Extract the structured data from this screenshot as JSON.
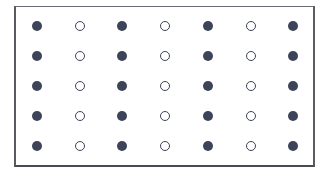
{
  "grid": {
    "rows": 5,
    "columns": 7,
    "pattern_description": "alternating filled and hollow dots by column; odd columns filled, even columns hollow",
    "column_types": [
      "filled",
      "hollow",
      "filled",
      "hollow",
      "filled",
      "hollow",
      "filled"
    ],
    "column_x": [
      37,
      80,
      122,
      165,
      208,
      251,
      293
    ],
    "row_y": [
      26,
      56,
      86,
      116,
      146
    ],
    "colors": {
      "dot": "#3d4358",
      "frame": "#5a5a62",
      "background": "#ffffff"
    }
  }
}
